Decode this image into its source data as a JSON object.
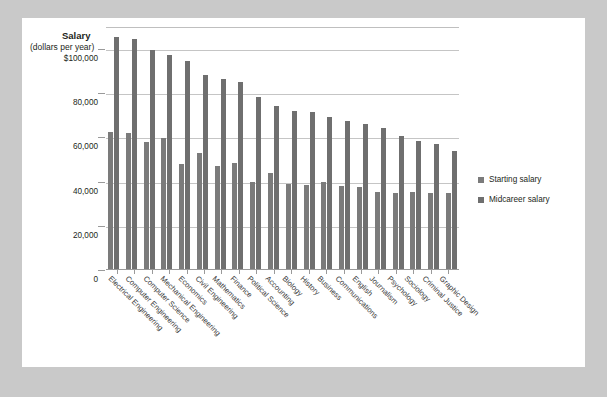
{
  "chart_data": {
    "type": "bar",
    "title": "Salary",
    "subtitle": "(dollars per year)",
    "xlabel": "",
    "ylabel": "Salary (dollars per year)",
    "ylim": [
      0,
      110000
    ],
    "grid": true,
    "legend_position": "right",
    "ytick_labels": [
      "$100,000",
      "80,000",
      "60,000",
      "40,000",
      "20,000",
      "0"
    ],
    "ytick_values": [
      100000,
      80000,
      60000,
      40000,
      20000,
      0
    ],
    "categories": [
      "Electrical Engineering",
      "Computer Engineering",
      "Computer Science",
      "Mechanical Engineering",
      "Economics",
      "Civil Engineering",
      "Mathematics",
      "Finance",
      "Political Science",
      "Accounting",
      "Biology",
      "History",
      "Business",
      "Communications",
      "English",
      "Journalism",
      "Psychology",
      "Sociology",
      "Criminal Justice",
      "Graphic Design"
    ],
    "series": [
      {
        "name": "Starting salary",
        "color": "#7b7b7b",
        "values": [
          62000,
          61500,
          57500,
          59500,
          47500,
          52500,
          46500,
          48000,
          39500,
          43500,
          38500,
          38000,
          39500,
          37500,
          37000,
          35000,
          34500,
          35000,
          34500,
          34500
        ]
      },
      {
        "name": "Midcareer salary",
        "color": "#6f6f6f",
        "values": [
          105000,
          104000,
          99000,
          97000,
          94000,
          88000,
          86000,
          84500,
          78000,
          74000,
          71500,
          71000,
          69000,
          67000,
          65500,
          64000,
          60000,
          58000,
          56500,
          53500
        ]
      }
    ],
    "legend": [
      "Starting salary",
      "Midcareer salary"
    ]
  },
  "legend": {
    "items": [
      {
        "label": "Starting salary"
      },
      {
        "label": "Midcareer salary"
      }
    ]
  }
}
